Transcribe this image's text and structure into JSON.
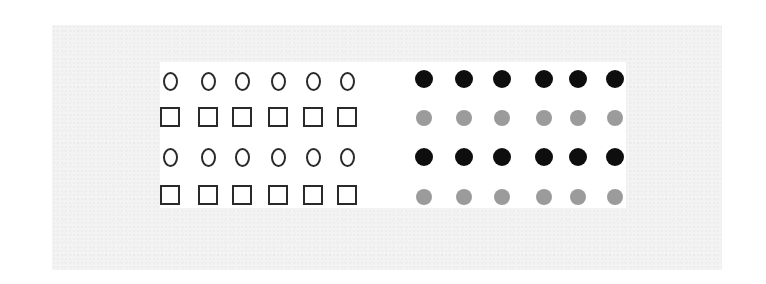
{
  "figure": {
    "colors": {
      "page_background": "#ffffff",
      "panel_background": "#f3f3f3",
      "inner_background": "#ffffff",
      "outline_stroke": "#2a2a2a",
      "dark_dot": "#0e0e0e",
      "light_dot": "#9b9b9b"
    },
    "left_grid": {
      "columns_x": [
        170,
        208,
        242,
        278,
        313,
        347
      ],
      "rows": [
        {
          "y": 81,
          "shape": "circle-outline",
          "count": 6
        },
        {
          "y": 117,
          "shape": "square-outline",
          "count": 6
        },
        {
          "y": 157,
          "shape": "circle-outline",
          "count": 6
        },
        {
          "y": 195,
          "shape": "square-outline",
          "count": 6
        }
      ]
    },
    "right_grid": {
      "columns_x": [
        424,
        464,
        502,
        544,
        578,
        615
      ],
      "rows": [
        {
          "y": 79,
          "shape": "dot",
          "tone": "dark",
          "size": 18,
          "count": 6
        },
        {
          "y": 118,
          "shape": "dot",
          "tone": "light",
          "size": 16,
          "count": 6
        },
        {
          "y": 157,
          "shape": "dot",
          "tone": "dark",
          "size": 18,
          "count": 6
        },
        {
          "y": 197,
          "shape": "dot",
          "tone": "light",
          "size": 16,
          "count": 6
        }
      ]
    }
  }
}
